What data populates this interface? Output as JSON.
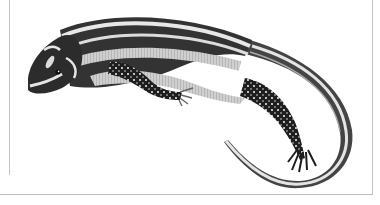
{
  "image": {
    "subject": "Striped lizard illustration",
    "style": "grayscale scientific engraving",
    "colors": {
      "background": "#ffffff",
      "body_dark": "#2a2a2a",
      "body_mid": "#6e6e6e",
      "stripe_light": "#e6e6e6",
      "frame_line": "#c4c4c4"
    }
  }
}
